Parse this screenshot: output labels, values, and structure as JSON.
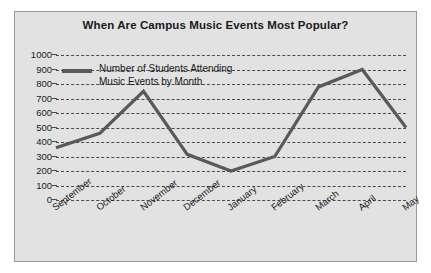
{
  "chart_data": {
    "type": "line",
    "title": "When Are Campus Music Events Most Popular?",
    "xlabel": "",
    "ylabel": "",
    "categories": [
      "September",
      "October",
      "November",
      "December",
      "January",
      "February",
      "March",
      "April",
      "May"
    ],
    "values": [
      360,
      460,
      750,
      315,
      200,
      300,
      780,
      900,
      500
    ],
    "series": [
      {
        "name": "Number of Students Attending Music Events by Month",
        "values": [
          360,
          460,
          750,
          315,
          200,
          300,
          780,
          900,
          500
        ]
      }
    ],
    "ylim": [
      0,
      1000
    ],
    "ytick_labels": [
      "1000",
      "900",
      "800",
      "700",
      "600",
      "500",
      "400",
      "300",
      "200",
      "100",
      "0"
    ],
    "ytick_values": [
      1000,
      900,
      800,
      700,
      600,
      500,
      400,
      300,
      200,
      100,
      0
    ],
    "grid": true,
    "grid_style": "dashed-horizontal",
    "legend_position": "top-left-inside",
    "legend_entries": [
      {
        "label_line1": "Number of Students Attending",
        "label_line2": "Music Events by Month",
        "color": "#595959"
      }
    ],
    "colors": {
      "line": "#595959",
      "panel_background": "#e2e2e2",
      "figure_background": "#ffffff",
      "grid": "#4a4a4a",
      "text": "#1a1a1a",
      "panel_border": "#9a9a9a"
    }
  }
}
